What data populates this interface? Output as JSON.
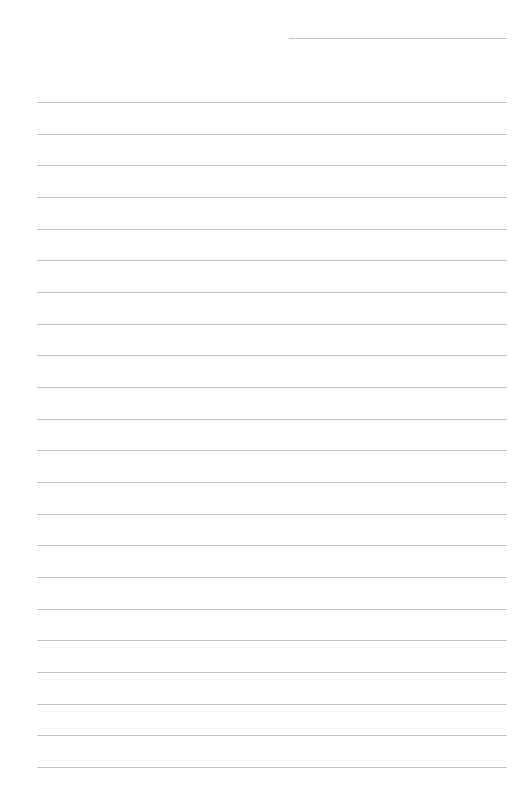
{
  "page": {
    "type": "lined-paper",
    "background_color": "#ffffff",
    "line_color": "#c4c4c4",
    "header_line": {
      "label": "",
      "x": 289,
      "y": 38,
      "width": 218
    },
    "rules": {
      "count": 22,
      "x": 37,
      "width": 470,
      "first_y": 102,
      "spacing": 31.67,
      "lines": [
        "",
        "",
        "",
        "",
        "",
        "",
        "",
        "",
        "",
        "",
        "",
        "",
        "",
        "",
        "",
        "",
        "",
        "",
        "",
        "",
        "",
        ""
      ]
    }
  }
}
